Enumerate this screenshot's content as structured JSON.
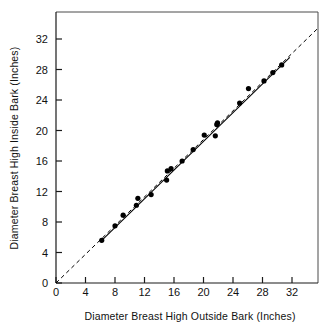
{
  "chart_data": {
    "type": "scatter",
    "title": "",
    "subtitle": "",
    "xlabel": "Diameter Breast High Outside Bark (Inches)",
    "ylabel": "Diameter Breast High Inside Bark (Inches)",
    "xlim": [
      0,
      36
    ],
    "ylim": [
      0,
      34
    ],
    "xticks": [
      0,
      4,
      8,
      12,
      16,
      20,
      24,
      28,
      32
    ],
    "yticks": [
      0,
      4,
      8,
      12,
      16,
      20,
      24,
      28,
      32
    ],
    "xtick_labels": [
      "0",
      "4",
      "8",
      "12",
      "16",
      "20",
      "24",
      "28",
      "32"
    ],
    "ytick_labels": [
      "0",
      "4",
      "8",
      "12",
      "16",
      "20",
      "24",
      "28",
      "32"
    ],
    "grid": false,
    "legend": false,
    "legend_position": "none",
    "series": [
      {
        "name": "Tree measurements",
        "marker": "filled-circle",
        "color": "#000000",
        "points": [
          [
            6.2,
            5.6
          ],
          [
            8.0,
            7.5
          ],
          [
            9.1,
            8.9
          ],
          [
            10.9,
            10.2
          ],
          [
            11.1,
            11.1
          ],
          [
            12.9,
            11.6
          ],
          [
            15.0,
            13.5
          ],
          [
            15.1,
            14.7
          ],
          [
            15.6,
            15.0
          ],
          [
            17.1,
            16.0
          ],
          [
            18.6,
            17.5
          ],
          [
            20.1,
            19.4
          ],
          [
            21.6,
            19.3
          ],
          [
            21.8,
            20.8
          ],
          [
            21.9,
            21.0
          ],
          [
            24.9,
            23.6
          ],
          [
            26.1,
            25.5
          ],
          [
            28.2,
            26.5
          ],
          [
            29.4,
            27.6
          ],
          [
            30.6,
            28.6
          ]
        ]
      }
    ],
    "annotations": [
      {
        "name": "regression-line",
        "kind": "line",
        "style": "solid",
        "from": [
          6.0,
          5.4
        ],
        "to": [
          31.7,
          29.6
        ]
      },
      {
        "name": "one-to-one-reference-line",
        "kind": "line",
        "style": "dashed",
        "from": [
          0.0,
          0.0
        ],
        "to": [
          35.5,
          33.4
        ]
      }
    ]
  },
  "axes": {
    "x_title": "Diameter Breast High Outside Bark (Inches)",
    "y_title": "Diameter Breast High Inside Bark (Inches)"
  },
  "colors": {
    "marker": "#000000",
    "line": "#000000",
    "frame": "#4a4a4a",
    "background": "#ffffff"
  }
}
